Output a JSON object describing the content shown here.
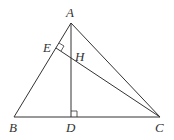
{
  "diagram": {
    "type": "geometry",
    "points": {
      "A": {
        "label": "A",
        "x": 71,
        "y": 23
      },
      "B": {
        "label": "B",
        "x": 14,
        "y": 117
      },
      "C": {
        "label": "C",
        "x": 160,
        "y": 117
      },
      "D": {
        "label": "D",
        "x": 71,
        "y": 117
      },
      "E": {
        "label": "E",
        "x": 56,
        "y": 48
      },
      "H": {
        "label": "H",
        "x": 71,
        "y": 61
      }
    },
    "segments": [
      "AB",
      "AC",
      "BC",
      "AD",
      "CE"
    ],
    "right_angles": [
      "ADC at D",
      "AEC at E"
    ],
    "colors": {
      "stroke": "#333333",
      "background": "#ffffff"
    }
  }
}
